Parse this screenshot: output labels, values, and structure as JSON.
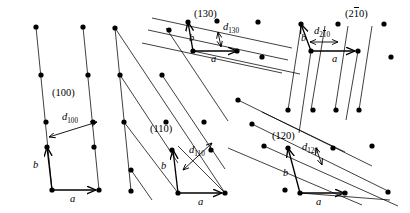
{
  "figure": {
    "kind": "crystal-lattice-planes-diagram",
    "background": "#ffffff",
    "ink": "#000000",
    "width": 410,
    "height": 213,
    "lattice": {
      "type": "oblique-2d",
      "a_vector_label": "a",
      "b_vector_label": "b",
      "dot_radius": 2.6,
      "a_step": [
        47,
        0
      ],
      "b_step": [
        5,
        -47
      ]
    }
  },
  "panels": [
    {
      "id": "p100",
      "miller_label": "(100)",
      "miller_pos": [
        52,
        88
      ],
      "d_label_base": "d",
      "d_label_sub": "100",
      "d_label_pos": [
        62,
        114
      ],
      "a_label_pos": [
        70,
        196
      ],
      "b_label_pos": [
        33,
        163
      ],
      "origin": [
        52,
        190
      ],
      "plane_count": 3,
      "plane_family": "vertical-steep"
    },
    {
      "id": "p110",
      "miller_label": "(110)",
      "miller_pos": [
        150,
        124
      ],
      "d_label_base": "d",
      "d_label_sub": "110",
      "d_label_pos": [
        190,
        148
      ],
      "a_label_pos": [
        200,
        199
      ],
      "b_label_pos": [
        162,
        163
      ],
      "origin": [
        178,
        193
      ],
      "plane_count": 5,
      "plane_family": "diagonal-down-right"
    },
    {
      "id": "p130",
      "miller_label": "(130)",
      "miller_pos": [
        194,
        11
      ],
      "d_label_base": "d",
      "d_label_sub": "130",
      "d_label_pos": [
        224,
        24
      ],
      "a_label_pos": [
        212,
        57
      ],
      "b_label_pos": [
        191,
        37
      ],
      "origin": [
        193,
        51
      ],
      "plane_count": 4,
      "plane_family": "shallow-down-right"
    },
    {
      "id": "p120",
      "miller_label": "(120)",
      "miller_pos": [
        273,
        132
      ],
      "d_label_base": "d",
      "d_label_sub": "120",
      "d_label_pos": [
        303,
        145
      ],
      "a_label_pos": [
        318,
        199
      ],
      "b_label_pos": [
        284,
        170
      ],
      "origin": [
        300,
        193
      ],
      "plane_count": 5,
      "plane_family": "shallow-down-right"
    },
    {
      "id": "p210bar",
      "miller_label_pre": "(2",
      "miller_label_bar": "1",
      "miller_label_post": "0)",
      "miller_pos": [
        346,
        11
      ],
      "d_label_base": "d",
      "d_label_sub_pre": "2",
      "d_label_sub_bar": "1",
      "d_label_sub_post": "0",
      "d_label_pos": [
        316,
        30
      ],
      "a_label_pos": [
        334,
        57
      ],
      "b_label_pos": [
        302,
        36
      ],
      "origin": [
        311,
        51
      ],
      "plane_count": 4,
      "plane_family": "steep-down-left"
    }
  ],
  "annotations": {
    "arrowhead_style": "open-v",
    "double_arrow_note": "d-spacing arrows are double-headed perpendicular to planes"
  }
}
